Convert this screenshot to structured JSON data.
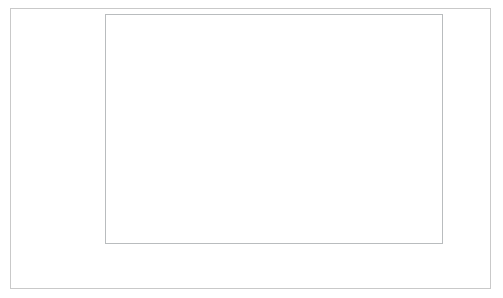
{
  "chart_data": {
    "type": "scatter",
    "title": "",
    "xlabel": "air_yards",
    "ylabel": "comp_pct",
    "xlim": [
      0.45,
      20.6
    ],
    "ylim": [
      0.4375,
      0.7775
    ],
    "xticks": [
      2.5,
      5.0,
      7.5,
      10.0,
      12.5,
      15.0,
      17.5,
      20.0
    ],
    "xtick_labels": [
      "2.5",
      "5.0",
      "7.5",
      "10.0",
      "12.5",
      "15.0",
      "17.5",
      "20.0"
    ],
    "yticks": [
      0.45,
      0.5,
      0.55,
      0.6,
      0.65,
      0.7,
      0.75
    ],
    "ytick_labels": [
      "0.45",
      "0.50",
      "0.55",
      "0.60",
      "0.65",
      "0.70",
      "0.75"
    ],
    "grid": true,
    "legend": false,
    "x": [
      1,
      2,
      3,
      4,
      5,
      6,
      7,
      8,
      9,
      10,
      11,
      12,
      13,
      14,
      15,
      16,
      17,
      18,
      19,
      20
    ],
    "y": [
      0.767,
      0.743,
      0.726,
      0.727,
      0.716,
      0.706,
      0.654,
      0.609,
      0.601,
      0.533,
      0.572,
      0.574,
      0.575,
      0.571,
      0.547,
      0.523,
      0.536,
      0.518,
      0.488,
      0.462
    ],
    "marker": {
      "shape": "circle",
      "size": 5.2,
      "color": "#41464a"
    },
    "regression": {
      "type": "linear-fit-with-ci",
      "line_color": "#9b9fa2",
      "band_color": "#d4d6d8",
      "x_start": 1.0,
      "y_start": 0.7475,
      "x_end": 20.0,
      "y_end": 0.4655,
      "ci_halfwidth_start": 0.0185,
      "ci_halfwidth_mid": 0.0045,
      "ci_halfwidth_end": 0.0125
    }
  },
  "axes": {
    "x_title": "air_yards",
    "y_title": "comp_pct"
  }
}
